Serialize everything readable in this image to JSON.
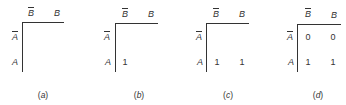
{
  "figure": {
    "col_labels": [
      "B",
      "B"
    ],
    "col_bar": [
      true,
      false
    ],
    "row_labels": [
      "A",
      "A"
    ],
    "row_bar": [
      true,
      false
    ],
    "panels": [
      {
        "id": "a",
        "caption_open": "(",
        "caption_letter": "a",
        "caption_close": ")",
        "cells": {
          "abar_bbar": "",
          "abar_b": "",
          "a_bbar": "",
          "a_b": ""
        }
      },
      {
        "id": "b",
        "caption_open": "(",
        "caption_letter": "b",
        "caption_close": ")",
        "cells": {
          "abar_bbar": "",
          "abar_b": "",
          "a_bbar": "1",
          "a_b": ""
        }
      },
      {
        "id": "c",
        "caption_open": "(",
        "caption_letter": "c",
        "caption_close": ")",
        "cells": {
          "abar_bbar": "",
          "abar_b": "",
          "a_bbar": "1",
          "a_b": "1"
        }
      },
      {
        "id": "d",
        "caption_open": "(",
        "caption_letter": "d",
        "caption_close": ")",
        "cells": {
          "abar_bbar": "0",
          "abar_b": "0",
          "a_bbar": "1",
          "a_b": "1"
        }
      }
    ]
  }
}
